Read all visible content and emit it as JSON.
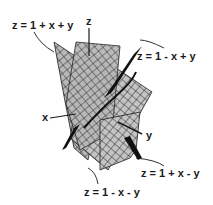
{
  "diagram": {
    "type": "3d-planes-intersection",
    "planes": [
      {
        "id": "p1",
        "equation": "z = 1 + x + y"
      },
      {
        "id": "p2",
        "equation": "z = 1 - x + y"
      },
      {
        "id": "p3",
        "equation": "z = 1 + x - y"
      },
      {
        "id": "p4",
        "equation": "z = 1 - x - y"
      }
    ],
    "axes": {
      "x": "x",
      "y": "y",
      "z": "z"
    },
    "colors": {
      "surface": "#c8c8c8",
      "grid": "#1e1e1e",
      "ink": "#1a1a1a",
      "background": "#ffffff"
    }
  }
}
